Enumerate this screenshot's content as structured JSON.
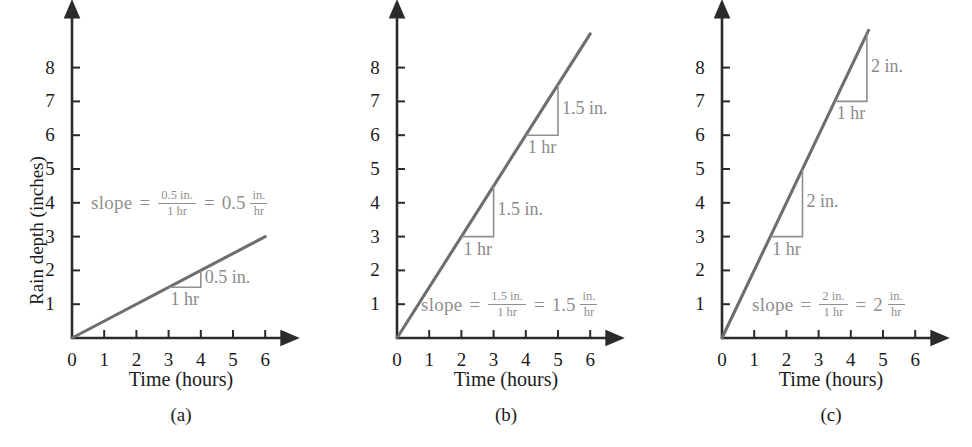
{
  "figure": {
    "panels": [
      {
        "letter": "(a)",
        "xlabel": "Time (hours)",
        "ylabel": "Rain depth (inches)",
        "xticks": [
          "0",
          "1",
          "2",
          "3",
          "4",
          "5",
          "6"
        ],
        "yticks": [
          "1",
          "2",
          "3",
          "4",
          "5",
          "6",
          "7",
          "8"
        ],
        "slope_value": "0.5",
        "slope_rise_label": "0.5 in.",
        "slope_run_label": "1 hr",
        "equation": {
          "word": "slope",
          "eq1": "=",
          "num": "0.5 in.",
          "den": "1 hr",
          "eq2": "=",
          "result": "0.5",
          "unit_num": "in.",
          "unit_den": "hr"
        },
        "triangles": [
          {
            "x0": 3,
            "y0": 1.5,
            "x1": 4,
            "y1": 2,
            "rise": "0.5 in.",
            "run": "1 hr"
          }
        ],
        "line": {
          "x0": 0,
          "y0": 0,
          "x1": 6,
          "y1": 3
        }
      },
      {
        "letter": "(b)",
        "xlabel": "Time (hours)",
        "ylabel": "",
        "xticks": [
          "0",
          "1",
          "2",
          "3",
          "4",
          "5",
          "6"
        ],
        "yticks": [
          "1",
          "2",
          "3",
          "4",
          "5",
          "6",
          "7",
          "8"
        ],
        "slope_value": "1.5",
        "slope_rise_label": "1.5 in.",
        "slope_run_label": "1 hr",
        "equation": {
          "word": "slope",
          "eq1": "=",
          "num": "1.5 in.",
          "den": "1 hr",
          "eq2": "=",
          "result": "1.5",
          "unit_num": "in.",
          "unit_den": "hr"
        },
        "triangles": [
          {
            "x0": 2,
            "y0": 3,
            "x1": 3,
            "y1": 4.5,
            "rise": "1.5 in.",
            "run": "1 hr"
          },
          {
            "x0": 4,
            "y0": 6,
            "x1": 5,
            "y1": 7.5,
            "rise": "1.5 in.",
            "run": "1 hr"
          }
        ],
        "line": {
          "x0": 0,
          "y0": 0,
          "x1": 6,
          "y1": 9
        }
      },
      {
        "letter": "(c)",
        "xlabel": "Time (hours)",
        "ylabel": "",
        "xticks": [
          "0",
          "1",
          "2",
          "3",
          "4",
          "5",
          "6"
        ],
        "yticks": [
          "1",
          "2",
          "3",
          "4",
          "5",
          "6",
          "7",
          "8"
        ],
        "slope_value": "2",
        "slope_rise_label": "2 in.",
        "slope_run_label": "1 hr",
        "equation": {
          "word": "slope",
          "eq1": "=",
          "num": "2 in.",
          "den": "1 hr",
          "eq2": "=",
          "result": "2",
          "unit_num": "in.",
          "unit_den": "hr"
        },
        "triangles": [
          {
            "x0": 1.5,
            "y0": 3,
            "x1": 2.5,
            "y1": 5,
            "rise": "2 in.",
            "run": "1 hr"
          },
          {
            "x0": 3.5,
            "y0": 7,
            "x1": 4.5,
            "y1": 9,
            "rise": "2 in.",
            "run": "1 hr"
          }
        ],
        "line": {
          "x0": 0,
          "y0": 0,
          "x1": 4.55,
          "y1": 9.1
        }
      }
    ],
    "colors": {
      "axis": "#2b2b2b",
      "data_line": "#6e6e6e",
      "annotation": "#8f8f8f",
      "text": "#1b1b1b",
      "background": "#ffffff"
    }
  },
  "chart_data": {
    "type": "line",
    "title": "",
    "xlabel": "Time (hours)",
    "ylabel": "Rain depth (inches)",
    "xlim": [
      0,
      6.6
    ],
    "ylim": [
      0,
      9.2
    ],
    "grid": false,
    "legend": "none",
    "panels": [
      {
        "label": "(a)",
        "slope": 0.5,
        "x": [
          0,
          6
        ],
        "y": [
          0,
          3
        ],
        "annotations": [
          "slope = 0.5 in. / 1 hr = 0.5 in./hr",
          "0.5 in.",
          "1 hr"
        ]
      },
      {
        "label": "(b)",
        "slope": 1.5,
        "x": [
          0,
          6
        ],
        "y": [
          0,
          9
        ],
        "annotations": [
          "slope = 1.5 in. / 1 hr = 1.5 in./hr",
          "1.5 in.",
          "1 hr",
          "1.5 in.",
          "1 hr"
        ]
      },
      {
        "label": "(c)",
        "slope": 2,
        "x": [
          0,
          4.55
        ],
        "y": [
          0,
          9.1
        ],
        "annotations": [
          "slope = 2 in. / 1 hr = 2 in./hr",
          "2 in.",
          "1 hr",
          "2 in.",
          "1 hr"
        ]
      }
    ]
  }
}
